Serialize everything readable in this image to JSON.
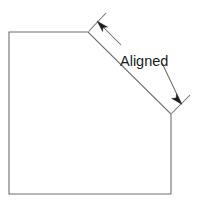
{
  "drawing": {
    "title": "Aligned dimension example",
    "background_color": "#ffffff",
    "line_color": "#6e6e6e",
    "arrow_color": "#1c1c1c",
    "text_color": "#1a1a1a",
    "dimension": {
      "label": "Aligned",
      "type": "aligned-dimension",
      "measures_edge": "chamfer"
    },
    "shape": {
      "name": "chamfered-rectangle",
      "vertices": "9,32 88,32 171,114 171,194 9,194",
      "edges": [
        {
          "name": "top-edge",
          "from": "9,32",
          "to": "88,32"
        },
        {
          "name": "chamfer-edge",
          "from": "88,32",
          "to": "171,114"
        },
        {
          "name": "right-edge",
          "from": "171,114",
          "to": "171,194"
        },
        {
          "name": "bottom-edge",
          "from": "171,194",
          "to": "9,194"
        },
        {
          "name": "left-edge",
          "from": "9,194",
          "to": "9,32"
        }
      ]
    },
    "extension_lines": [
      {
        "name": "upper-extension-line",
        "path": "M 88.5 31.5 L 106 13"
      },
      {
        "name": "lower-extension-line",
        "path": "M 171.5 113.5 L 190 95"
      }
    ],
    "dimension_line": {
      "name": "aligned-dimension-line",
      "segment_a": "M 97.5 21.5 L 121 45",
      "segment_b": "M 162 63 L 181.5 104"
    },
    "arrowheads": [
      {
        "name": "upper-arrowhead",
        "points": "97.2,21.2 107.5,27.0 103.0,27.5 102.6,31.6",
        "direction": "up-left"
      },
      {
        "name": "lower-arrowhead",
        "points": "181.8,104.3 171.6,98.4 176.1,97.9 176.5,93.8",
        "direction": "down-right"
      }
    ],
    "text_position": {
      "x": 120,
      "y": 66
    }
  }
}
